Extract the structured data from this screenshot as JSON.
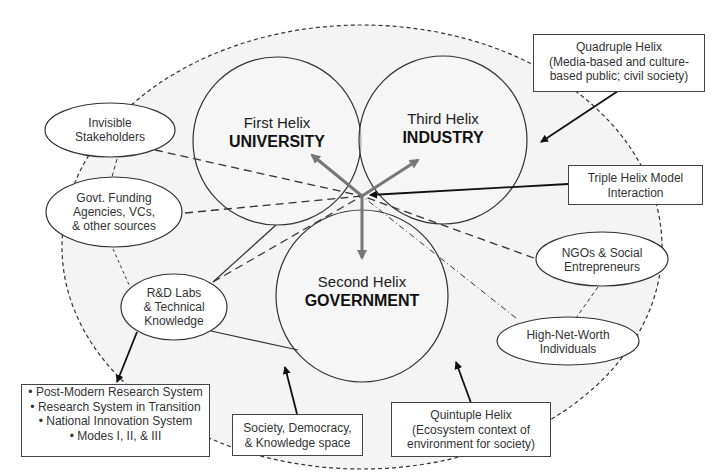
{
  "helices": {
    "first": {
      "sub": "First Helix",
      "main": "UNIVERSITY"
    },
    "third": {
      "sub": "Third Helix",
      "main": "INDUSTRY"
    },
    "second": {
      "sub": "Second Helix",
      "main": "GOVERNMENT"
    }
  },
  "stakeholders": {
    "invisible": [
      "Invisible",
      "Stakeholders"
    ],
    "funding": [
      "Govt. Funding",
      "Agencies, VCs,",
      "& other sources"
    ],
    "rnd": [
      "R&D Labs",
      "& Technical",
      "Knowledge"
    ],
    "ngos": [
      "NGOs & Social",
      "Entrepreneurs"
    ],
    "hnwi": [
      "High-Net-Worth",
      "Individuals"
    ]
  },
  "boxes": {
    "quadruple": [
      "Quadruple Helix",
      "(Media-based and culture-",
      "based public; civil society)"
    ],
    "triple": [
      "Triple Helix Model",
      "Interaction"
    ],
    "quintuple": [
      "Quintuple Helix",
      "(Ecosystem context of",
      "environment for society)"
    ],
    "society": [
      "Society, Democracy,",
      "& Knowledge space"
    ],
    "research": [
      "• Post-Modern Research System",
      "• Research System in Transition",
      "• National Innovation System",
      "• Modes I, II, & III"
    ]
  },
  "colors": {
    "outer_fill": "#f4f4f4",
    "stroke": "#333333",
    "center_arrow": "#777777"
  }
}
